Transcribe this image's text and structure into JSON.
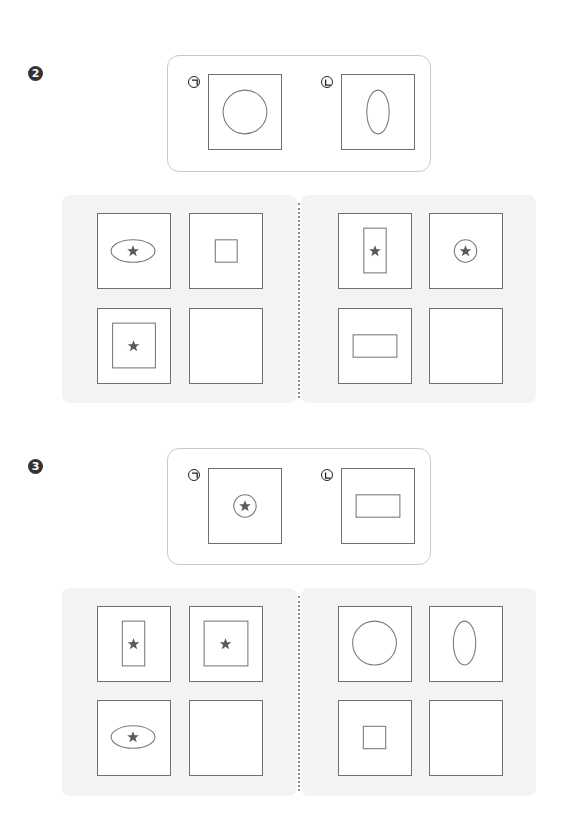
{
  "colors": {
    "panel_gray": "#f3f3f3",
    "box_border": "#6f6f6f",
    "shape_stroke": "#7a7a7a",
    "star_fill": "#5a5a5a",
    "example_border": "#c9c9c9",
    "badge_fill": "#333333"
  },
  "problems": [
    {
      "number": "2",
      "number_glyph": "❷",
      "examples": [
        {
          "label": "ㄱ",
          "shape": "circle",
          "star": false
        },
        {
          "label": "ㄴ",
          "shape": "vertical-ellipse",
          "star": false
        }
      ],
      "grids": [
        {
          "name": "left",
          "cells": [
            {
              "shape": "horizontal-ellipse",
              "star": true
            },
            {
              "shape": "small-square",
              "star": false
            },
            {
              "shape": "large-square",
              "star": true
            },
            {
              "shape": "empty",
              "star": false
            }
          ]
        },
        {
          "name": "right",
          "cells": [
            {
              "shape": "vertical-rectangle",
              "star": true
            },
            {
              "shape": "small-circle",
              "star": true
            },
            {
              "shape": "horizontal-rectangle",
              "star": false
            },
            {
              "shape": "empty",
              "star": false
            }
          ]
        }
      ]
    },
    {
      "number": "3",
      "number_glyph": "❸",
      "examples": [
        {
          "label": "ㄱ",
          "shape": "small-circle",
          "star": true
        },
        {
          "label": "ㄴ",
          "shape": "horizontal-rectangle",
          "star": false
        }
      ],
      "grids": [
        {
          "name": "left",
          "cells": [
            {
              "shape": "vertical-rectangle",
              "star": true
            },
            {
              "shape": "large-square",
              "star": true
            },
            {
              "shape": "horizontal-ellipse",
              "star": true
            },
            {
              "shape": "empty",
              "star": false
            }
          ]
        },
        {
          "name": "right",
          "cells": [
            {
              "shape": "circle",
              "star": false
            },
            {
              "shape": "vertical-ellipse",
              "star": false
            },
            {
              "shape": "small-square",
              "star": false
            },
            {
              "shape": "empty",
              "star": false
            }
          ]
        }
      ]
    }
  ]
}
